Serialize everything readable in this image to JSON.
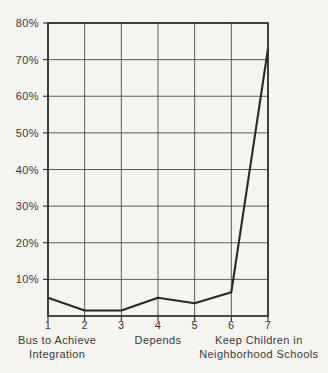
{
  "chart_data": {
    "type": "line",
    "title": "",
    "xlabel": "",
    "ylabel": "",
    "x": [
      1,
      2,
      3,
      4,
      5,
      6,
      7
    ],
    "values": [
      5,
      1.5,
      1.5,
      5,
      3.5,
      6.5,
      73
    ],
    "series_name": "Percent of responses",
    "xlim": [
      1,
      7
    ],
    "ylim": [
      0,
      80
    ],
    "grid": true,
    "legend": "none",
    "xtick_labels": [
      "1",
      "2",
      "3",
      "4",
      "5",
      "6",
      "7"
    ],
    "ytick_values": [
      10,
      20,
      30,
      40,
      50,
      60,
      70,
      80
    ],
    "ytick_labels": [
      "10%",
      "20%",
      "30%",
      "40%",
      "50%",
      "60%",
      "70%",
      "80%"
    ],
    "axis_annotations": [
      {
        "position": 1.25,
        "lines": [
          "Bus to Achieve",
          "Integration"
        ]
      },
      {
        "position": 4.0,
        "lines": [
          "Depends"
        ]
      },
      {
        "position": 6.75,
        "lines": [
          "Keep Children in",
          "Neighborhood Schools"
        ]
      }
    ],
    "colors": {
      "background": "#f5f4f1",
      "grid": "#4e4b46",
      "frame": "#2e2c29",
      "line": "#2a2825",
      "text": "#3b3935"
    }
  }
}
